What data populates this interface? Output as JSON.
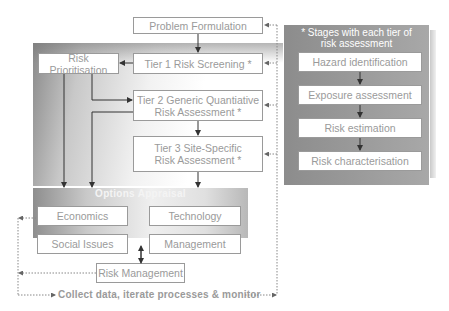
{
  "diagram": {
    "main_flow": {
      "problem_formulation": "Problem Formulation",
      "tier1": "Tier 1 Risk Screening *",
      "tier2_line1": "Tier 2 Generic Quantiative",
      "tier2_line2": "Risk Assessment *",
      "tier3_line1": "Tier 3 Site-Specific",
      "tier3_line2": "Risk Assessment *",
      "risk_prioritisation": "Risk Prioritisation"
    },
    "stages_panel": {
      "title_line1": "* Stages with each tier of",
      "title_line2": "risk assessment",
      "stages": [
        "Hazard identification",
        "Exposure assessment",
        "Risk estimation",
        "Risk characterisation"
      ]
    },
    "options_panel": {
      "title": "Options Appraisal",
      "items": [
        "Economics",
        "Technology",
        "Social Issues",
        "Management"
      ]
    },
    "risk_management": "Risk Management",
    "footer": "Collect data, iterate processes & monitor",
    "colors": {
      "box_border": "#9a9a9a",
      "box_text": "#9a9a9a",
      "panel_dark": "#8c8c8c",
      "arrow": "#333333",
      "dotted": "#888888"
    }
  }
}
